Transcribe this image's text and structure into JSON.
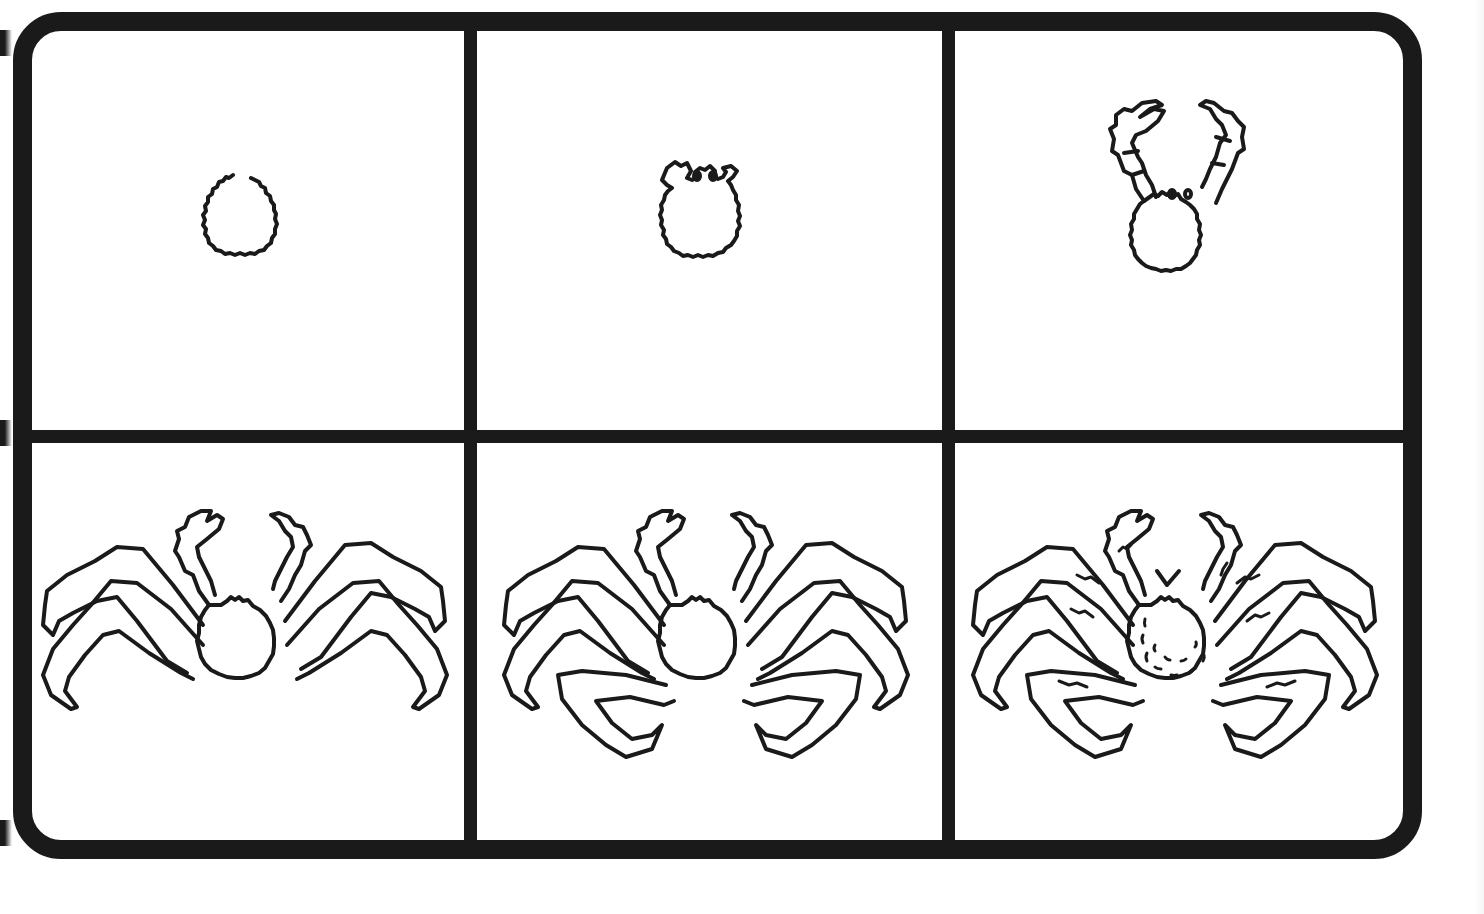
{
  "page": {
    "title": "",
    "layout": {
      "rows": 2,
      "columns": 3
    }
  },
  "colors": {
    "line": "#1a1a1a",
    "background": "#ffffff"
  },
  "steps": [
    {
      "index": 1,
      "label": "",
      "content": "oval-body-outline"
    },
    {
      "index": 2,
      "label": "",
      "content": "body-with-eye-stalks"
    },
    {
      "index": 3,
      "label": "",
      "content": "body-with-claws"
    },
    {
      "index": 4,
      "label": "",
      "content": "claws-and-two-leg-pairs"
    },
    {
      "index": 5,
      "label": "",
      "content": "all-legs-added"
    },
    {
      "index": 6,
      "label": "",
      "content": "detailed-shell-texture"
    }
  ]
}
